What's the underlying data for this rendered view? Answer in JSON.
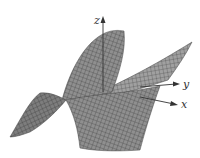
{
  "figure": {
    "type": "3d-surface-plot",
    "colors": {
      "background": "#ffffff",
      "surface_fill": "#8c8c8c",
      "surface_dark": "#5a5a5a",
      "grid_lines": "#3a3a3a",
      "axis": "#333333"
    },
    "axes": {
      "z": {
        "label": "z"
      },
      "y": {
        "label": "y"
      },
      "x": {
        "label": "x"
      }
    }
  }
}
